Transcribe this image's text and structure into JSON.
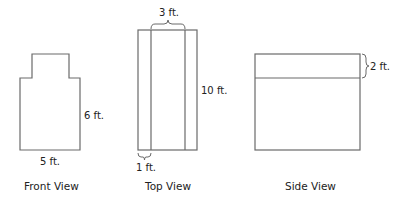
{
  "views": {
    "front": {
      "caption": "Front View",
      "height_label": "6 ft.",
      "width_label": "5 ft."
    },
    "top": {
      "caption": "Top View",
      "inner_width_label": "3 ft.",
      "length_label": "10 ft.",
      "side_strip_label": "1 ft."
    },
    "side": {
      "caption": "Side View",
      "top_band_label": "2 ft."
    }
  },
  "colors": {
    "stroke": "#6a6a6a",
    "text": "#222222",
    "background": "#ffffff"
  }
}
